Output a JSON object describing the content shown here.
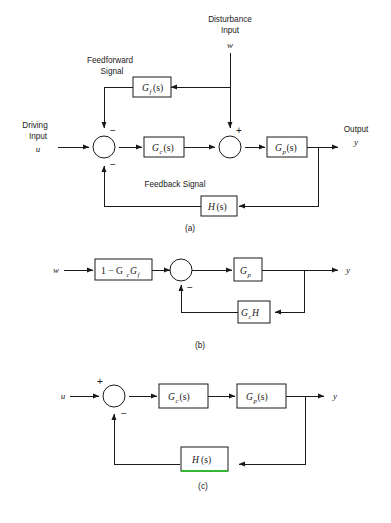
{
  "figure": {
    "background_color": "#ffffff",
    "line_color": "#1a1a1a",
    "highlight_color": "#19c319"
  },
  "diagram_a": {
    "caption": "(a)",
    "labels": {
      "disturbance_input": "Disturbance",
      "disturbance_input_2": "Input",
      "disturbance_var": "w",
      "feedforward_1": "Feedforward",
      "feedforward_2": "Signal",
      "driving_1": "Driving",
      "driving_2": "Input",
      "driving_var": "u",
      "output_1": "Output",
      "output_var": "y",
      "feedback_signal": "Feedback Signal"
    },
    "blocks": [
      {
        "name": "Gf",
        "main": "G",
        "sub": "f",
        "arg": "(s)"
      },
      {
        "name": "Gc",
        "main": "G",
        "sub": "c",
        "arg": "(s)"
      },
      {
        "name": "Gp",
        "main": "G",
        "sub": "p",
        "arg": "(s)"
      },
      {
        "name": "H",
        "main": "H",
        "sub": "",
        "arg": "(s)"
      }
    ],
    "summing_junctions": [
      {
        "name": "junction-1",
        "signs": [
          "−",
          "−"
        ]
      },
      {
        "name": "junction-2",
        "signs": [
          "+"
        ]
      }
    ]
  },
  "diagram_b": {
    "caption": "(b)",
    "labels": {
      "input_var": "w",
      "output_var": "y"
    },
    "blocks": [
      {
        "name": "one-minus-GcGf",
        "text": "1 − G",
        "sub1": "c",
        "text2": "G",
        "sub2": "f"
      },
      {
        "name": "Gp",
        "main": "G",
        "sub": "p",
        "arg": ""
      },
      {
        "name": "GcH",
        "main": "G",
        "sub": "c",
        "arg": "H"
      }
    ],
    "summing_junctions": [
      {
        "name": "junction-1",
        "signs": [
          "−"
        ]
      }
    ]
  },
  "diagram_c": {
    "caption": "(c)",
    "labels": {
      "input_var": "u",
      "output_var": "y"
    },
    "blocks": [
      {
        "name": "Gc",
        "main": "G",
        "sub": "c",
        "arg": "(s)"
      },
      {
        "name": "Gp",
        "main": "G",
        "sub": "p",
        "arg": "(s)"
      },
      {
        "name": "H",
        "main": "H",
        "sub": "",
        "arg": "(s)",
        "highlighted_edge": "bottom"
      }
    ],
    "summing_junctions": [
      {
        "name": "junction-1",
        "signs": [
          "+",
          "−"
        ]
      }
    ]
  }
}
